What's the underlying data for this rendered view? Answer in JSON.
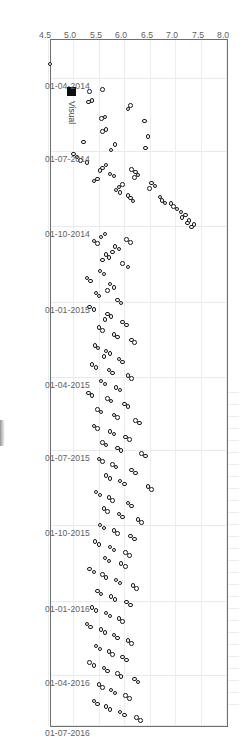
{
  "chart_data": {
    "type": "scatter",
    "title": "",
    "xlabel": "",
    "ylabel": "",
    "orientation": "rotated-90-clockwise",
    "grid": true,
    "legend": {
      "position": "bottom-left-inside",
      "entries": [
        {
          "label": "Visual",
          "marker": "filled-square",
          "color": "#0d0e10"
        }
      ]
    },
    "x_axis": {
      "name": "date",
      "type": "date",
      "range": [
        "01-04-2014",
        "01-07-2016"
      ],
      "tick_labels": [
        "01-04-2014",
        "01-07-2014",
        "01-10-2014",
        "01-01-2015",
        "01-04-2015",
        "01-07-2015",
        "01-10-2015",
        "01-01-2016",
        "01-04-2016",
        "01-07-2016"
      ],
      "tick_positions_frac": [
        0.055,
        0.161,
        0.27,
        0.381,
        0.49,
        0.596,
        0.705,
        0.815,
        0.923,
        0.995
      ]
    },
    "y_axis": {
      "name": "value",
      "type": "numeric",
      "range": [
        4.5,
        8.0
      ],
      "tick_labels": [
        "4.5",
        "5.0",
        "5.5",
        "6.0",
        "6.5",
        "7.0",
        "7.5",
        "8.0"
      ],
      "tick_values": [
        4.5,
        5.0,
        5.5,
        6.0,
        6.5,
        7.0,
        7.5,
        8.0
      ]
    },
    "marker_style": {
      "shape": "open-circle",
      "edge_color": "#17181a",
      "face_color": "#ffffff",
      "size_px": 4.6
    },
    "series": [
      {
        "name": "Visual",
        "points": [
          [
            0.035,
            4.52
          ],
          [
            0.072,
            5.55
          ],
          [
            0.075,
            5.3
          ],
          [
            0.088,
            5.35
          ],
          [
            0.09,
            5.28
          ],
          [
            0.112,
            5.6
          ],
          [
            0.114,
            5.53
          ],
          [
            0.13,
            5.62
          ],
          [
            0.133,
            5.55
          ],
          [
            0.148,
            5.18
          ],
          [
            0.152,
            5.8
          ],
          [
            0.16,
            5.72
          ],
          [
            0.095,
            6.1
          ],
          [
            0.1,
            6.05
          ],
          [
            0.118,
            6.38
          ],
          [
            0.14,
            6.45
          ],
          [
            0.157,
            6.4
          ],
          [
            0.175,
            5.12
          ],
          [
            0.178,
            5.25
          ],
          [
            0.182,
            5.62
          ],
          [
            0.186,
            5.55
          ],
          [
            0.19,
            5.5
          ],
          [
            0.195,
            5.7
          ],
          [
            0.198,
            5.78
          ],
          [
            0.202,
            5.45
          ],
          [
            0.205,
            5.38
          ],
          [
            0.21,
            5.95
          ],
          [
            0.214,
            5.88
          ],
          [
            0.218,
            5.82
          ],
          [
            0.222,
            5.9
          ],
          [
            0.188,
            6.12
          ],
          [
            0.192,
            6.2
          ],
          [
            0.196,
            6.25
          ],
          [
            0.2,
            6.18
          ],
          [
            0.226,
            6.05
          ],
          [
            0.23,
            6.1
          ],
          [
            0.234,
            6.15
          ],
          [
            0.208,
            6.52
          ],
          [
            0.212,
            6.58
          ],
          [
            0.216,
            6.48
          ],
          [
            0.238,
            6.9
          ],
          [
            0.242,
            6.95
          ],
          [
            0.246,
            7.02
          ],
          [
            0.25,
            7.1
          ],
          [
            0.254,
            7.18
          ],
          [
            0.258,
            7.12
          ],
          [
            0.262,
            7.25
          ],
          [
            0.266,
            7.22
          ],
          [
            0.228,
            6.68
          ],
          [
            0.233,
            6.72
          ],
          [
            0.237,
            6.78
          ],
          [
            0.268,
            7.35
          ],
          [
            0.272,
            7.3
          ],
          [
            0.17,
            5.05
          ],
          [
            0.166,
            4.98
          ],
          [
            0.282,
            5.6
          ],
          [
            0.286,
            5.52
          ],
          [
            0.292,
            5.38
          ],
          [
            0.296,
            5.45
          ],
          [
            0.3,
            5.8
          ],
          [
            0.304,
            5.88
          ],
          [
            0.308,
            5.75
          ],
          [
            0.312,
            5.62
          ],
          [
            0.316,
            5.68
          ],
          [
            0.32,
            5.55
          ],
          [
            0.29,
            6.02
          ],
          [
            0.294,
            6.1
          ],
          [
            0.325,
            5.95
          ],
          [
            0.33,
            6.05
          ],
          [
            0.336,
            5.5
          ],
          [
            0.34,
            5.58
          ],
          [
            0.346,
            5.25
          ],
          [
            0.35,
            5.32
          ],
          [
            0.355,
            5.7
          ],
          [
            0.36,
            5.78
          ],
          [
            0.364,
            5.65
          ],
          [
            0.368,
            5.42
          ],
          [
            0.372,
            5.48
          ],
          [
            0.378,
            5.85
          ],
          [
            0.382,
            5.92
          ],
          [
            0.388,
            5.3
          ],
          [
            0.392,
            5.38
          ],
          [
            0.398,
            5.65
          ],
          [
            0.402,
            5.72
          ],
          [
            0.406,
            5.6
          ],
          [
            0.41,
            5.95
          ],
          [
            0.414,
            6.02
          ],
          [
            0.418,
            5.48
          ],
          [
            0.422,
            5.55
          ],
          [
            0.428,
            5.78
          ],
          [
            0.432,
            5.85
          ],
          [
            0.436,
            6.12
          ],
          [
            0.44,
            6.18
          ],
          [
            0.444,
            5.4
          ],
          [
            0.448,
            5.46
          ],
          [
            0.452,
            5.62
          ],
          [
            0.456,
            5.7
          ],
          [
            0.46,
            5.58
          ],
          [
            0.464,
            5.88
          ],
          [
            0.468,
            5.95
          ],
          [
            0.472,
            5.35
          ],
          [
            0.476,
            5.42
          ],
          [
            0.48,
            5.68
          ],
          [
            0.484,
            5.75
          ],
          [
            0.488,
            6.05
          ],
          [
            0.492,
            6.12
          ],
          [
            0.496,
            5.52
          ],
          [
            0.5,
            5.6
          ],
          [
            0.505,
            5.82
          ],
          [
            0.509,
            5.9
          ],
          [
            0.513,
            5.28
          ],
          [
            0.517,
            5.35
          ],
          [
            0.521,
            5.65
          ],
          [
            0.525,
            5.72
          ],
          [
            0.529,
            5.98
          ],
          [
            0.533,
            6.05
          ],
          [
            0.537,
            5.45
          ],
          [
            0.541,
            5.52
          ],
          [
            0.545,
            5.78
          ],
          [
            0.549,
            5.85
          ],
          [
            0.553,
            6.2
          ],
          [
            0.557,
            6.28
          ],
          [
            0.561,
            5.38
          ],
          [
            0.565,
            5.45
          ],
          [
            0.569,
            5.7
          ],
          [
            0.573,
            5.78
          ],
          [
            0.577,
            6.0
          ],
          [
            0.581,
            6.08
          ],
          [
            0.585,
            5.55
          ],
          [
            0.589,
            5.62
          ],
          [
            0.593,
            5.85
          ],
          [
            0.597,
            5.92
          ],
          [
            0.601,
            6.32
          ],
          [
            0.605,
            6.4
          ],
          [
            0.609,
            5.48
          ],
          [
            0.613,
            5.55
          ],
          [
            0.617,
            5.75
          ],
          [
            0.621,
            5.82
          ],
          [
            0.625,
            6.12
          ],
          [
            0.629,
            6.2
          ],
          [
            0.633,
            5.62
          ],
          [
            0.637,
            5.7
          ],
          [
            0.641,
            5.9
          ],
          [
            0.645,
            5.98
          ],
          [
            0.649,
            6.45
          ],
          [
            0.653,
            6.52
          ],
          [
            0.657,
            5.42
          ],
          [
            0.661,
            5.5
          ],
          [
            0.665,
            5.68
          ],
          [
            0.669,
            5.75
          ],
          [
            0.673,
            6.05
          ],
          [
            0.677,
            6.12
          ],
          [
            0.681,
            5.58
          ],
          [
            0.685,
            5.65
          ],
          [
            0.689,
            5.88
          ],
          [
            0.693,
            5.95
          ],
          [
            0.697,
            6.25
          ],
          [
            0.701,
            6.32
          ],
          [
            0.705,
            5.5
          ],
          [
            0.709,
            5.58
          ],
          [
            0.713,
            5.78
          ],
          [
            0.717,
            5.85
          ],
          [
            0.721,
            6.1
          ],
          [
            0.725,
            6.18
          ],
          [
            0.729,
            5.4
          ],
          [
            0.733,
            5.48
          ],
          [
            0.737,
            5.7
          ],
          [
            0.741,
            5.78
          ],
          [
            0.745,
            6.0
          ],
          [
            0.749,
            6.08
          ],
          [
            0.753,
            5.6
          ],
          [
            0.757,
            5.68
          ],
          [
            0.761,
            5.92
          ],
          [
            0.765,
            6.0
          ],
          [
            0.769,
            5.3
          ],
          [
            0.773,
            5.38
          ],
          [
            0.777,
            5.55
          ],
          [
            0.781,
            5.62
          ],
          [
            0.785,
            5.82
          ],
          [
            0.789,
            5.9
          ],
          [
            0.793,
            6.15
          ],
          [
            0.797,
            6.22
          ],
          [
            0.801,
            5.45
          ],
          [
            0.805,
            5.52
          ],
          [
            0.809,
            5.72
          ],
          [
            0.813,
            5.8
          ],
          [
            0.817,
            6.02
          ],
          [
            0.821,
            6.1
          ],
          [
            0.825,
            5.35
          ],
          [
            0.829,
            5.42
          ],
          [
            0.833,
            5.62
          ],
          [
            0.837,
            5.7
          ],
          [
            0.841,
            5.88
          ],
          [
            0.845,
            5.95
          ],
          [
            0.849,
            5.25
          ],
          [
            0.853,
            5.32
          ],
          [
            0.857,
            5.52
          ],
          [
            0.861,
            5.6
          ],
          [
            0.865,
            5.78
          ],
          [
            0.869,
            5.85
          ],
          [
            0.873,
            6.05
          ],
          [
            0.877,
            6.12
          ],
          [
            0.881,
            5.42
          ],
          [
            0.885,
            5.5
          ],
          [
            0.889,
            5.68
          ],
          [
            0.893,
            5.75
          ],
          [
            0.897,
            5.95
          ],
          [
            0.901,
            6.02
          ],
          [
            0.905,
            5.3
          ],
          [
            0.909,
            5.38
          ],
          [
            0.913,
            5.58
          ],
          [
            0.917,
            5.65
          ],
          [
            0.921,
            5.85
          ],
          [
            0.925,
            5.92
          ],
          [
            0.929,
            6.18
          ],
          [
            0.933,
            6.25
          ],
          [
            0.937,
            5.48
          ],
          [
            0.941,
            5.55
          ],
          [
            0.945,
            5.72
          ],
          [
            0.949,
            5.8
          ],
          [
            0.953,
            6.0
          ],
          [
            0.957,
            6.08
          ],
          [
            0.961,
            5.38
          ],
          [
            0.965,
            5.45
          ],
          [
            0.969,
            5.62
          ],
          [
            0.973,
            5.7
          ],
          [
            0.977,
            5.9
          ],
          [
            0.981,
            5.98
          ],
          [
            0.985,
            6.22
          ],
          [
            0.989,
            6.3
          ]
        ]
      }
    ]
  }
}
